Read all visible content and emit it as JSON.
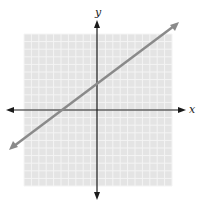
{
  "diagram": {
    "type": "coordinate_plane",
    "x_axis_label": "x",
    "y_axis_label": "y",
    "grid_units_per_side": 10,
    "line": {
      "slope": 0.75,
      "y_intercept": 4,
      "color": "#8a8a8a"
    },
    "colors": {
      "grid_background": "#e4e4e4",
      "grid_lines": "#f4f4f4",
      "axes": "#1a1a1a"
    }
  }
}
